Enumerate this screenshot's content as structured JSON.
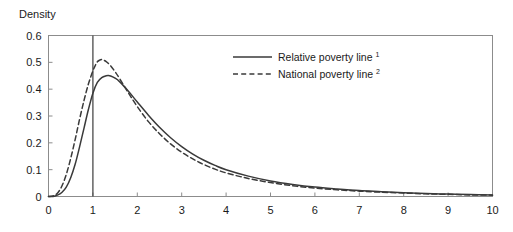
{
  "chart_data": {
    "type": "line",
    "title": "",
    "xlabel": "",
    "ylabel": "Density",
    "xlim": [
      0,
      10
    ],
    "ylim": [
      0,
      0.6
    ],
    "grid": false,
    "legend_position": "top-center-right",
    "xticks": [
      "0",
      "1",
      "2",
      "3",
      "4",
      "5",
      "6",
      "7",
      "8",
      "9",
      "10"
    ],
    "yticks": [
      "0",
      "0.1",
      "0.2",
      "0.3",
      "0.4",
      "0.5",
      "0.6"
    ],
    "annotations": [
      {
        "name": "poverty-threshold-line",
        "type": "vline",
        "x": 1,
        "style": "solid"
      }
    ],
    "series": [
      {
        "name": "Relative poverty line",
        "footnote": "1",
        "style": "solid",
        "color": "#3a3a3a",
        "x": [
          0.0,
          0.1,
          0.2,
          0.3,
          0.4,
          0.5,
          0.6,
          0.7,
          0.8,
          0.9,
          1.0,
          1.1,
          1.2,
          1.3,
          1.35,
          1.4,
          1.5,
          1.6,
          1.8,
          2.0,
          2.25,
          2.5,
          2.75,
          3.0,
          3.25,
          3.5,
          3.75,
          4.0,
          4.5,
          5.0,
          5.5,
          6.0,
          6.5,
          7.0,
          7.5,
          8.0,
          8.5,
          9.0,
          9.5,
          10.0
        ],
        "values": [
          0.0,
          0.0,
          0.005,
          0.015,
          0.035,
          0.07,
          0.12,
          0.185,
          0.255,
          0.325,
          0.385,
          0.425,
          0.443,
          0.45,
          0.451,
          0.449,
          0.441,
          0.428,
          0.392,
          0.352,
          0.303,
          0.258,
          0.219,
          0.186,
          0.158,
          0.135,
          0.116,
          0.1,
          0.076,
          0.058,
          0.045,
          0.035,
          0.028,
          0.022,
          0.018,
          0.014,
          0.011,
          0.009,
          0.007,
          0.006
        ]
      },
      {
        "name": "National poverty line",
        "footnote": "2",
        "style": "dashed",
        "color": "#3a3a3a",
        "x": [
          0.0,
          0.1,
          0.2,
          0.3,
          0.4,
          0.5,
          0.6,
          0.7,
          0.8,
          0.9,
          1.0,
          1.05,
          1.1,
          1.15,
          1.2,
          1.3,
          1.4,
          1.5,
          1.6,
          1.8,
          2.0,
          2.25,
          2.5,
          2.75,
          3.0,
          3.25,
          3.5,
          3.75,
          4.0,
          4.5,
          5.0,
          5.5,
          6.0,
          6.5,
          7.0,
          7.5,
          8.0,
          8.5,
          9.0,
          9.5,
          10.0
        ],
        "values": [
          0.0,
          0.002,
          0.012,
          0.038,
          0.082,
          0.142,
          0.212,
          0.288,
          0.358,
          0.42,
          0.468,
          0.487,
          0.502,
          0.508,
          0.51,
          0.503,
          0.487,
          0.465,
          0.44,
          0.386,
          0.335,
          0.279,
          0.234,
          0.196,
          0.165,
          0.14,
          0.119,
          0.102,
          0.088,
          0.067,
          0.052,
          0.04,
          0.031,
          0.025,
          0.02,
          0.016,
          0.013,
          0.01,
          0.008,
          0.006,
          0.005
        ]
      }
    ]
  },
  "legend": {
    "items": [
      {
        "label": "Relative poverty line",
        "sup": "1",
        "style": "solid"
      },
      {
        "label": "National poverty line",
        "sup": "2",
        "style": "dashed"
      }
    ]
  },
  "colors": {
    "line": "#3a3a3a",
    "frame": "#8c8c8c",
    "text": "#1a1a1a"
  }
}
